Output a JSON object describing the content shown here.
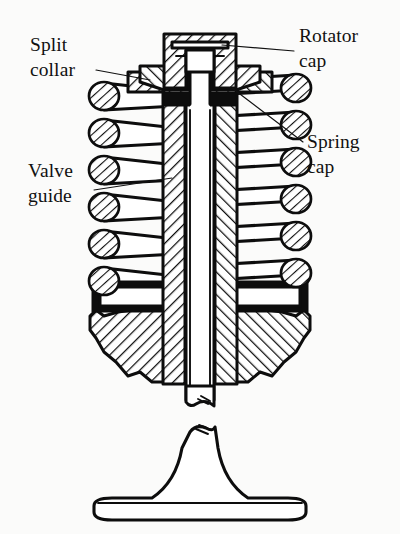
{
  "figure": {
    "style": "scanned line drawing, sectioned engineering illustration",
    "background_color": "#fbfbfa",
    "ink_color": "#0d0d0d"
  },
  "callouts": [
    {
      "id": "split-collar",
      "line1": "Split",
      "line2": "collar",
      "side": "left",
      "text_x": 30,
      "text_y_line1": 51,
      "text_y_line2": 76,
      "leader": "M 96 70 L 150 80",
      "points_to": "tapered split collar wedge under rotator cap"
    },
    {
      "id": "rotator-cap",
      "line1": "Rotator",
      "line2": "cap",
      "side": "right",
      "text_x": 299,
      "text_y_line1": 42,
      "text_y_line2": 67,
      "leader": "M 294 51 L 222 45",
      "points_to": "rotator cap at top of valve stem"
    },
    {
      "id": "spring-cap",
      "line1": "Spring",
      "line2": "cap",
      "side": "right",
      "text_x": 307,
      "text_y_line1": 148,
      "text_y_line2": 173,
      "leader": "M 303 142 L 232 88",
      "points_to": "spring cap seat beneath split collar"
    },
    {
      "id": "valve-guide",
      "line1": "Valve",
      "line2": "guide",
      "side": "left",
      "text_x": 28,
      "text_y_line1": 177,
      "text_y_line2": 202,
      "leader": "M 94 190 L 172 178",
      "points_to": "hatched valve guide sleeve around stem"
    }
  ],
  "components": {
    "rotator_cap": "sectioned cap with cross-hatched walls at stem top",
    "split_collar": "pair of tapered wedge collars gripping stem groove",
    "spring_cap": "flanged seat carrying the top coil of the spring",
    "valve_spring": "helical spring shown in section, six coil turns per side",
    "valve_guide": "hatched cylindrical sleeve guiding the valve stem",
    "cylinder_head": "broken-out casting section at spring base",
    "valve_stem": "vertical shaft running through guide, interrupted by break line",
    "valve_head": "mushroom-shaped valve head at bottom below break"
  },
  "spring": {
    "turns_per_side": 6,
    "left_coil_y": [
      96,
      133,
      170,
      207,
      244,
      281
    ],
    "right_coil_y": [
      88,
      125,
      162,
      199,
      236,
      273
    ],
    "coil_radius": 15
  }
}
